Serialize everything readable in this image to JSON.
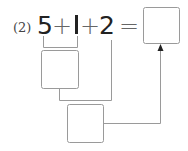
{
  "problem": {
    "label": "(2)",
    "expression": [
      {
        "type": "number",
        "text": "5"
      },
      {
        "type": "operator",
        "text": "+"
      },
      {
        "type": "number",
        "text": "1"
      },
      {
        "type": "operator",
        "text": "+"
      },
      {
        "type": "number",
        "text": "2"
      },
      {
        "type": "operator",
        "text": "="
      }
    ],
    "boxes": {
      "answer": "",
      "partial_sum_5_plus_1": "",
      "partial_sum_plus_2": ""
    }
  },
  "colors": {
    "text": "#222222",
    "operator": "#666666",
    "lines": "#9a9a9a"
  }
}
